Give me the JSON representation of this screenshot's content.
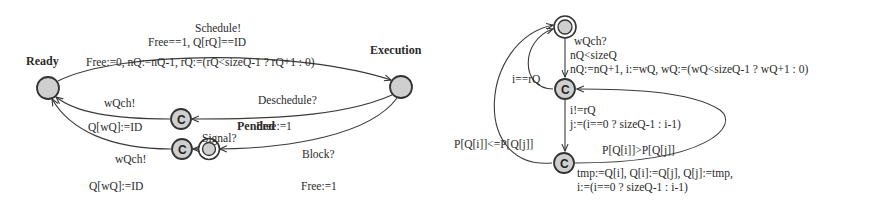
{
  "left_automaton": {
    "name": "task-automaton",
    "locations": {
      "ready": {
        "label": "Ready",
        "type": "initial"
      },
      "execution": {
        "label": "Execution",
        "type": "normal"
      },
      "pended": {
        "label": "Pended",
        "type": "normal-double"
      },
      "commit_deschedule": {
        "label": "C",
        "type": "committed"
      },
      "commit_signal": {
        "label": "C",
        "type": "committed"
      }
    },
    "edges": {
      "schedule": {
        "sync": "Schedule!",
        "guard": "Free==1, Q[rQ]==ID",
        "update": "Free:=0, nQ:=nQ-1, rQ:=(rQ<sizeQ-1 ? rQ+1 : 0)"
      },
      "deschedule": {
        "sync": "Deschedule?",
        "update": "Free:=1"
      },
      "deschedule_to_ready": {
        "sync": "wQch!",
        "update": "Q[wQ]:=ID"
      },
      "block": {
        "sync": "Block?",
        "update": "Free:=1"
      },
      "signal": {
        "sync": "Signal?"
      },
      "signal_to_ready": {
        "sync": "wQch!",
        "update": "Q[wQ]:=ID"
      }
    }
  },
  "right_automaton": {
    "name": "queue-automaton",
    "locations": {
      "idle": {
        "label": "",
        "type": "initial-double"
      },
      "check": {
        "label": "C",
        "type": "committed"
      },
      "swap": {
        "label": "C",
        "type": "committed"
      }
    },
    "edges": {
      "enqueue": {
        "sync": "wQch?",
        "guard": "nQ<sizeQ",
        "update": "nQ:=nQ+1, i:=wQ, wQ:=(wQ<sizeQ-1 ? wQ+1 : 0)"
      },
      "done_front": {
        "guard": "i==rQ"
      },
      "compare": {
        "guard": "i!=rQ",
        "update": "j:=(i==0 ? sizeQ-1 : i-1)"
      },
      "in_order": {
        "guard": "P[Q[i]]<=P[Q[j]]"
      },
      "swap_loop": {
        "guard": "P[Q[i]]>P[Q[j]]",
        "update_line1": "tmp:=Q[i], Q[i]:=Q[j], Q[j]:=tmp,",
        "update_line2": "i:=(i==0 ? sizeQ-1 : i-1)"
      }
    }
  }
}
